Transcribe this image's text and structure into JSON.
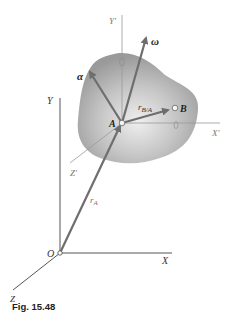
{
  "figure": {
    "caption": "Fig. 15.48",
    "labels": {
      "Y": "Y",
      "X": "X",
      "Z": "Z",
      "O": "O",
      "Y_prime": "Y'",
      "X_prime": "X'",
      "Z_prime": "Z'",
      "A": "A",
      "B": "B",
      "omega": "ω",
      "alpha": "α",
      "r_B_A": "r",
      "r_B_A_sub": "B/A",
      "r_A": "r",
      "r_A_sub": "A"
    },
    "colors": {
      "body_fill": "#a8a8a8",
      "body_highlight": "#e6e6e6",
      "axis_line": "#555555",
      "light_axis_line": "#999999",
      "vector": "#6e6e6e"
    }
  }
}
